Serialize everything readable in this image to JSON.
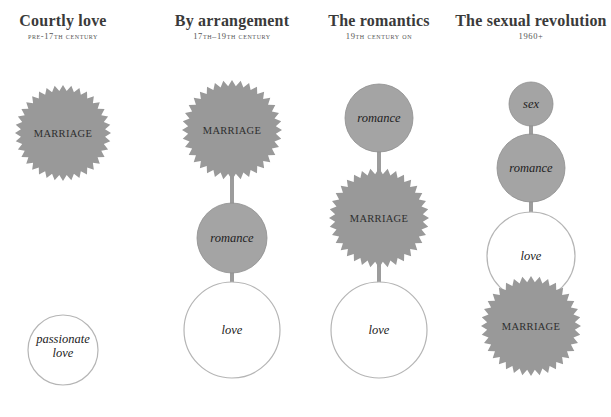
{
  "colors": {
    "marriage_fill": "#999999",
    "romance_fill": "#a4a4a4",
    "love_fill": "#ffffff",
    "love_stroke": "#b5b5b5",
    "connector": "#9c9c9c"
  },
  "columns": [
    {
      "title": "Courtly love",
      "subtitle": "Pre-17th century",
      "x": 63,
      "nodes": [
        {
          "label": "MARRIAGE",
          "shape": "star",
          "cx": 63,
          "cy": 133,
          "r": 48
        },
        {
          "label": "passionate love",
          "label_lines": [
            "passionate",
            "love"
          ],
          "shape": "circle-light",
          "cx": 63,
          "cy": 350,
          "r": 35
        }
      ],
      "connected": false
    },
    {
      "title": "By arrangement",
      "subtitle": "17th–19th century",
      "x": 232,
      "nodes": [
        {
          "label": "MARRIAGE",
          "shape": "star",
          "cx": 232,
          "cy": 130,
          "r": 50
        },
        {
          "label": "romance",
          "shape": "circle-grey",
          "cx": 232,
          "cy": 238,
          "r": 35
        },
        {
          "label": "love",
          "shape": "circle-light",
          "cx": 232,
          "cy": 330,
          "r": 48
        }
      ],
      "connected": true
    },
    {
      "title": "The romantics",
      "subtitle": "19th century on",
      "x": 379,
      "nodes": [
        {
          "label": "romance",
          "shape": "circle-grey",
          "cx": 379,
          "cy": 118,
          "r": 34
        },
        {
          "label": "MARRIAGE",
          "shape": "star",
          "cx": 379,
          "cy": 218,
          "r": 50
        },
        {
          "label": "love",
          "shape": "circle-light",
          "cx": 379,
          "cy": 330,
          "r": 48
        }
      ],
      "connected": true
    },
    {
      "title": "The sexual revolution",
      "subtitle": "1960+",
      "x": 531,
      "nodes": [
        {
          "label": "sex",
          "shape": "circle-grey",
          "cx": 531,
          "cy": 104,
          "r": 22
        },
        {
          "label": "romance",
          "shape": "circle-grey",
          "cx": 531,
          "cy": 168,
          "r": 34
        },
        {
          "label": "love",
          "shape": "circle-light",
          "cx": 531,
          "cy": 256,
          "r": 44
        },
        {
          "label": "MARRIAGE",
          "shape": "star",
          "cx": 531,
          "cy": 326,
          "r": 50
        }
      ],
      "connected": true
    }
  ]
}
